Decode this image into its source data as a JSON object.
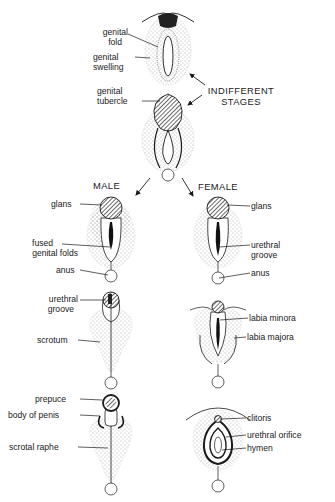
{
  "figure": {
    "headings": {
      "indifferent": [
        "INDIFFERENT",
        "STAGES"
      ],
      "male": "MALE",
      "female": "FEMALE"
    },
    "indifferent_labels": {
      "genital_fold": [
        "genital",
        "fold"
      ],
      "genital_swelling": [
        "genital",
        "swelling"
      ],
      "genital_tubercle": [
        "genital",
        "tubercle"
      ]
    },
    "male_labels": {
      "glans": "glans",
      "fused_genital_folds": [
        "fused",
        "genital folds"
      ],
      "anus": "anus",
      "urethral_groove": [
        "urethral",
        "groove"
      ],
      "scrotum": "scrotum",
      "prepuce": "prepuce",
      "body_of_penis": "body of penis",
      "scrotal_raphe": "scrotal raphe"
    },
    "female_labels": {
      "glans": "glans",
      "urethral_groove": [
        "urethral",
        "groove"
      ],
      "anus": "anus",
      "labia_minora": "labia minora",
      "labia_majora": "labia majora",
      "clitoris": "clitoris",
      "urethral_orifice": "urethral orifice",
      "hymen": "hymen"
    },
    "colors": {
      "ink": "#1a1a1a",
      "background": "#ffffff"
    }
  }
}
